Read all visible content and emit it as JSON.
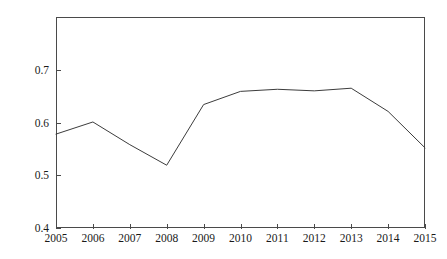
{
  "chart_data": {
    "type": "line",
    "title": "",
    "subtitle": "",
    "xlabel": "",
    "ylabel": "",
    "categories": [
      "2005",
      "2006",
      "2007",
      "2008",
      "2009",
      "2010",
      "2011",
      "2012",
      "2013",
      "2014",
      "2015"
    ],
    "x": [
      2005,
      2006,
      2007,
      2008,
      2009,
      2010,
      2011,
      2012,
      2013,
      2014,
      2015
    ],
    "values": [
      0.578,
      0.601,
      0.558,
      0.519,
      0.634,
      0.659,
      0.663,
      0.66,
      0.665,
      0.621,
      0.552
    ],
    "series": [
      {
        "name": "",
        "values": [
          0.578,
          0.601,
          0.558,
          0.519,
          0.634,
          0.659,
          0.663,
          0.66,
          0.665,
          0.621,
          0.552
        ]
      }
    ],
    "xlim": [
      2005,
      2015
    ],
    "ylim": [
      0.4,
      0.8
    ],
    "y_ticks": [
      0.4,
      0.5,
      0.6,
      0.7
    ],
    "y_tick_labels": [
      "0.4",
      "0.5",
      "0.6",
      "0.7"
    ],
    "x_ticks": [
      2005,
      2006,
      2007,
      2008,
      2009,
      2010,
      2011,
      2012,
      2013,
      2014,
      2015
    ],
    "x_tick_labels": [
      "2005",
      "2006",
      "2007",
      "2008",
      "2009",
      "2010",
      "2011",
      "2012",
      "2013",
      "2014",
      "2015"
    ],
    "grid": false,
    "legend": false,
    "legend_position": "none",
    "line_color": "#3c3c3c",
    "axis_color": "#4a4a4a",
    "background_color": "#ffffff",
    "annotations": []
  }
}
